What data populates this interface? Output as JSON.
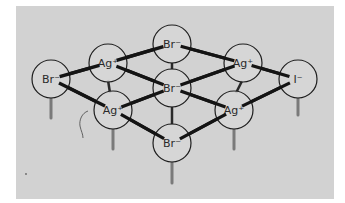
{
  "figure": {
    "title": "",
    "colors": {
      "panel_background": "#d2d2d2",
      "ion_fill": "#d6d6d6",
      "ion_stroke": "#1e1e1e",
      "bond": "#141414",
      "stick": "#7a7a7a",
      "label": "#2a2a2a"
    }
  },
  "ions": [
    {
      "id": "br-left",
      "label": "Br⁻",
      "species": "bromide",
      "cx": 51,
      "cy": 79
    },
    {
      "id": "ag-top-left",
      "label": "Ag⁺",
      "species": "silver",
      "cx": 108,
      "cy": 63
    },
    {
      "id": "br-top",
      "label": "Br⁻",
      "species": "bromide",
      "cx": 172,
      "cy": 44
    },
    {
      "id": "ag-top-right",
      "label": "Ag⁺",
      "species": "silver",
      "cx": 243,
      "cy": 63
    },
    {
      "id": "i-right",
      "label": "I⁻",
      "species": "iodide",
      "cx": 298,
      "cy": 79
    },
    {
      "id": "br-center",
      "label": "Br⁻",
      "species": "bromide",
      "cx": 172,
      "cy": 88
    },
    {
      "id": "ag-bottom-left",
      "label": "Ag⁺",
      "species": "silver",
      "cx": 113,
      "cy": 110
    },
    {
      "id": "ag-bottom-right",
      "label": "Ag⁺",
      "species": "silver",
      "cx": 234,
      "cy": 110
    },
    {
      "id": "br-bottom",
      "label": "Br⁻",
      "species": "bromide",
      "cx": 172,
      "cy": 143
    }
  ],
  "bonds": [
    [
      "br-left",
      "ag-top-left"
    ],
    [
      "br-left",
      "ag-bottom-left"
    ],
    [
      "ag-top-left",
      "br-top"
    ],
    [
      "ag-top-left",
      "br-center"
    ],
    [
      "br-top",
      "ag-top-right"
    ],
    [
      "ag-top-right",
      "br-center"
    ],
    [
      "ag-top-right",
      "i-right"
    ],
    [
      "i-right",
      "ag-bottom-right"
    ],
    [
      "br-center",
      "ag-bottom-left"
    ],
    [
      "br-center",
      "ag-bottom-right"
    ],
    [
      "ag-bottom-left",
      "br-bottom"
    ],
    [
      "ag-bottom-right",
      "br-bottom"
    ]
  ],
  "annotations": {
    "hand_mark": "curved pencil mark left of lower-left Ag⁺"
  }
}
